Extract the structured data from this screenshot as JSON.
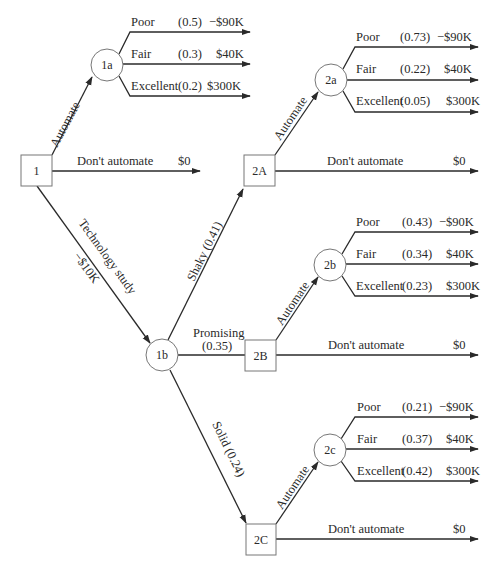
{
  "diagram": {
    "type": "decision-tree",
    "nodes": {
      "n1": {
        "label": "1",
        "kind": "decision"
      },
      "n1a": {
        "label": "1a",
        "kind": "chance"
      },
      "n1b": {
        "label": "1b",
        "kind": "chance"
      },
      "n2A": {
        "label": "2A",
        "kind": "decision"
      },
      "n2B": {
        "label": "2B",
        "kind": "decision"
      },
      "n2C": {
        "label": "2C",
        "kind": "decision"
      },
      "n2a": {
        "label": "2a",
        "kind": "chance"
      },
      "n2b": {
        "label": "2b",
        "kind": "chance"
      },
      "n2c": {
        "label": "2c",
        "kind": "chance"
      }
    },
    "edges": {
      "automate_1": "Automate",
      "dont_automate_1": "Don't automate",
      "dont_automate_1_value": "$0",
      "tech_study": "Technology study",
      "tech_study_cost": "−$10K",
      "shaky": "Shaky (0.41)",
      "promising": "Promising",
      "promising_prob": "(0.35)",
      "solid": "Solid (0.24)",
      "automate_2A": "Automate",
      "automate_2B": "Automate",
      "automate_2C": "Automate",
      "dont_automate_2A": "Don't automate",
      "dont_automate_2A_value": "$0",
      "dont_automate_2B": "Don't automate",
      "dont_automate_2B_value": "$0",
      "dont_automate_2C": "Don't automate",
      "dont_automate_2C_value": "$0"
    },
    "outcomes": {
      "n1a": [
        {
          "label": "Poor",
          "prob": "(0.5)",
          "value": "−$90K"
        },
        {
          "label": "Fair",
          "prob": "(0.3)",
          "value": "$40K"
        },
        {
          "label": "Excellent",
          "prob": "(0.2)",
          "value": "$300K"
        }
      ],
      "n2a": [
        {
          "label": "Poor",
          "prob": "(0.73)",
          "value": "−$90K"
        },
        {
          "label": "Fair",
          "prob": "(0.22)",
          "value": "$40K"
        },
        {
          "label": "Excellent",
          "prob": "(0.05)",
          "value": "$300K"
        }
      ],
      "n2b": [
        {
          "label": "Poor",
          "prob": "(0.43)",
          "value": "−$90K"
        },
        {
          "label": "Fair",
          "prob": "(0.34)",
          "value": "$40K"
        },
        {
          "label": "Excellent",
          "prob": "(0.23)",
          "value": "$300K"
        }
      ],
      "n2c": [
        {
          "label": "Poor",
          "prob": "(0.21)",
          "value": "−$90K"
        },
        {
          "label": "Fair",
          "prob": "(0.37)",
          "value": "$40K"
        },
        {
          "label": "Excellent",
          "prob": "(0.42)",
          "value": "$300K"
        }
      ]
    },
    "colors": {
      "line": "#2a2a2a",
      "node_border": "#777777",
      "background": "#ffffff"
    }
  }
}
